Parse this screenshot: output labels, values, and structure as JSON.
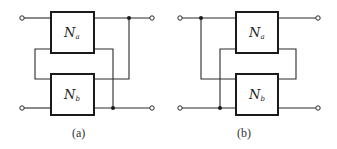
{
  "figure": {
    "panels": [
      {
        "id": "a",
        "caption": "(a)",
        "boxes": [
          {
            "name": "N",
            "subscript": "a"
          },
          {
            "name": "N",
            "subscript": "b"
          }
        ],
        "description": "Outputs connected in series-parallel: Na output top joined to Nb output top; Na output bottom joined to Nb output bottom terminal line"
      },
      {
        "id": "b",
        "caption": "(b)",
        "boxes": [
          {
            "name": "N",
            "subscript": "a"
          },
          {
            "name": "N",
            "subscript": "b"
          }
        ],
        "description": "Mirror arrangement: interconnection on input side, loop on output side"
      }
    ],
    "colors": {
      "line": "#1a1a1a",
      "background": "#ffffff"
    }
  }
}
